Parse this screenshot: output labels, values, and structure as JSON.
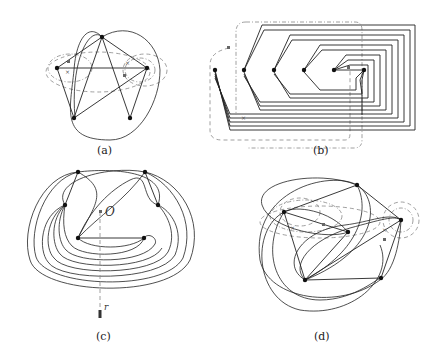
{
  "figure": {
    "panels": [
      {
        "id": "a",
        "caption": "(a)"
      },
      {
        "id": "b",
        "caption": "(b)"
      },
      {
        "id": "c",
        "caption": "(c)",
        "labels": {
          "origin": "O",
          "ray": "r"
        }
      },
      {
        "id": "d",
        "caption": "(d)"
      }
    ],
    "colors": {
      "edge": "#222222",
      "dashed": "#888888",
      "vertex": "#111111"
    }
  }
}
